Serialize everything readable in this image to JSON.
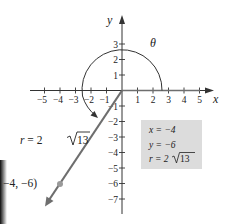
{
  "figure": {
    "x_axis_label": "x",
    "y_axis_label": "y",
    "angle_label": "θ",
    "x_ticks": [
      "−5",
      "−4",
      "−3",
      "−2",
      "−1",
      "1",
      "2",
      "3",
      "4",
      "5"
    ],
    "y_ticks_positive": [
      "1",
      "2",
      "3"
    ],
    "y_ticks_negative": [
      "−1",
      "−2",
      "−3",
      "−4",
      "−5",
      "−6",
      "−7"
    ],
    "radius_label": {
      "prefix": "r = 2",
      "radicand": "13"
    },
    "point_label": "−4, −6)",
    "info_box": {
      "x_line": "x = −4",
      "y_line": "y = −6",
      "r_prefix": "r = 2",
      "r_radicand": "13"
    },
    "colors": {
      "axis": "#333333",
      "ray": "#6e6e6e",
      "point": "#9a9a9a",
      "box_fill": "#dcdcdc",
      "edge_shadow": "#111111"
    }
  }
}
